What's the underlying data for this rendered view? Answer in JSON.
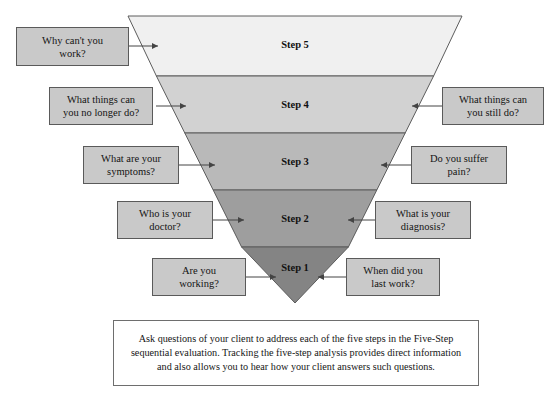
{
  "diagram": {
    "funnel": {
      "shape": "inverted-triangle",
      "bands": [
        {
          "label": "Step 5",
          "color": "#f0f0f0"
        },
        {
          "label": "Step 4",
          "color": "#d2d2d2"
        },
        {
          "label": "Step 3",
          "color": "#b9b9b9"
        },
        {
          "label": "Step 2",
          "color": "#9e9e9e"
        },
        {
          "label": "Step 1",
          "color": "#848484"
        }
      ]
    },
    "callouts_left": [
      {
        "line1": "Why can't you",
        "line2": "work?"
      },
      {
        "line1": "What things can",
        "line2": "you no longer do?"
      },
      {
        "line1": "What are your",
        "line2": "symptoms?"
      },
      {
        "line1": "Who is your",
        "line2": "doctor?"
      },
      {
        "line1": "Are you",
        "line2": "working?"
      }
    ],
    "callouts_right": [
      {
        "line1": "What things can",
        "line2": "you still do?"
      },
      {
        "line1": "Do you suffer",
        "line2": "pain?"
      },
      {
        "line1": "What is your",
        "line2": "diagnosis?"
      },
      {
        "line1": "When did you",
        "line2": "last work?"
      }
    ],
    "caption": "Ask questions of your client to address each of the five steps in the Five-Step sequential evaluation. Tracking the five-step analysis provides direct information and also allows you to hear how your client answers such questions."
  }
}
